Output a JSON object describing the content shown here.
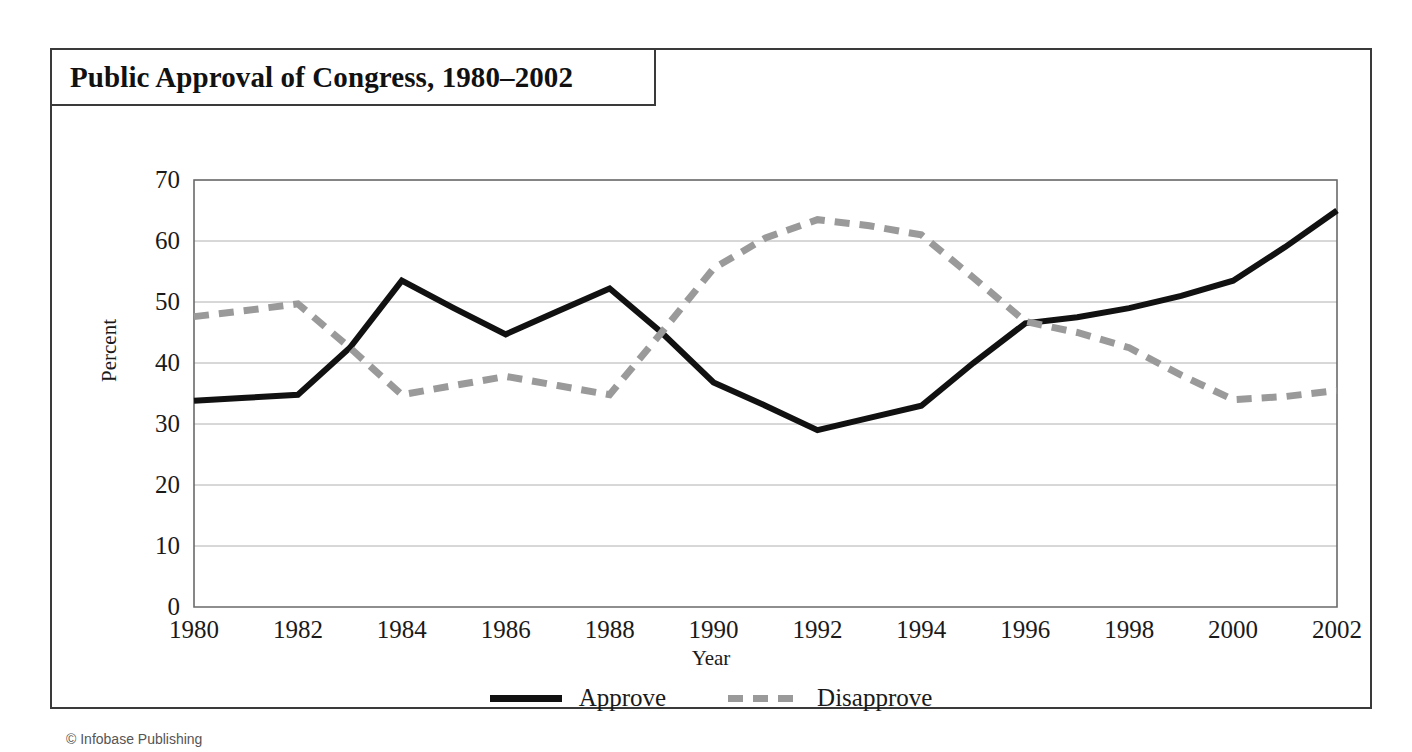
{
  "figure": {
    "title": "Public Approval of Congress, 1980–2002",
    "credit": "© Infobase Publishing",
    "frame_color": "#3a3a3a"
  },
  "chart_data": {
    "type": "line",
    "title": "Public Approval of Congress, 1980–2002",
    "xlabel": "Year",
    "ylabel": "Percent",
    "xlim": [
      1980,
      2002
    ],
    "ylim": [
      0,
      70
    ],
    "ytick_labels": [
      "0",
      "10",
      "20",
      "30",
      "40",
      "50",
      "60",
      "70"
    ],
    "yticks": [
      0,
      10,
      20,
      30,
      40,
      50,
      60,
      70
    ],
    "xtick_labels": [
      "1980",
      "1982",
      "1984",
      "1986",
      "1988",
      "1990",
      "1992",
      "1994",
      "1996",
      "1998",
      "2000",
      "2002"
    ],
    "xticks": [
      1980,
      1982,
      1984,
      1986,
      1988,
      1990,
      1992,
      1994,
      1996,
      1998,
      2000,
      2002
    ],
    "grid": "horizontal",
    "legend_position": "bottom-center",
    "x": [
      1980,
      1981,
      1982,
      1983,
      1984,
      1985,
      1986,
      1987,
      1988,
      1989,
      1990,
      1991,
      1992,
      1993,
      1994,
      1995,
      1996,
      1997,
      1998,
      1999,
      2000,
      2001,
      2002
    ],
    "series": [
      {
        "name": "Approve",
        "style": "solid",
        "color": "#111111",
        "values": [
          33.8,
          34.3,
          34.8,
          42.5,
          53.5,
          49.0,
          44.7,
          48.5,
          52.2,
          45.0,
          36.8,
          33.0,
          29.0,
          31.0,
          33.0,
          40.0,
          46.5,
          47.5,
          49.0,
          51.0,
          53.5,
          59.0,
          65.0
        ]
      },
      {
        "name": "Disapprove",
        "style": "dashed",
        "color": "#9a9a9a",
        "values": [
          47.6,
          48.6,
          49.7,
          42.5,
          34.8,
          36.3,
          37.8,
          36.3,
          34.8,
          45.0,
          55.5,
          60.5,
          63.5,
          62.5,
          61.0,
          54.0,
          46.8,
          45.0,
          42.5,
          38.0,
          34.0,
          34.5,
          35.5
        ]
      }
    ]
  },
  "legend": {
    "items": [
      {
        "label": "Approve",
        "swatch": "solid-line-swatch"
      },
      {
        "label": "Disapprove",
        "swatch": "dashed-line-swatch"
      }
    ]
  }
}
